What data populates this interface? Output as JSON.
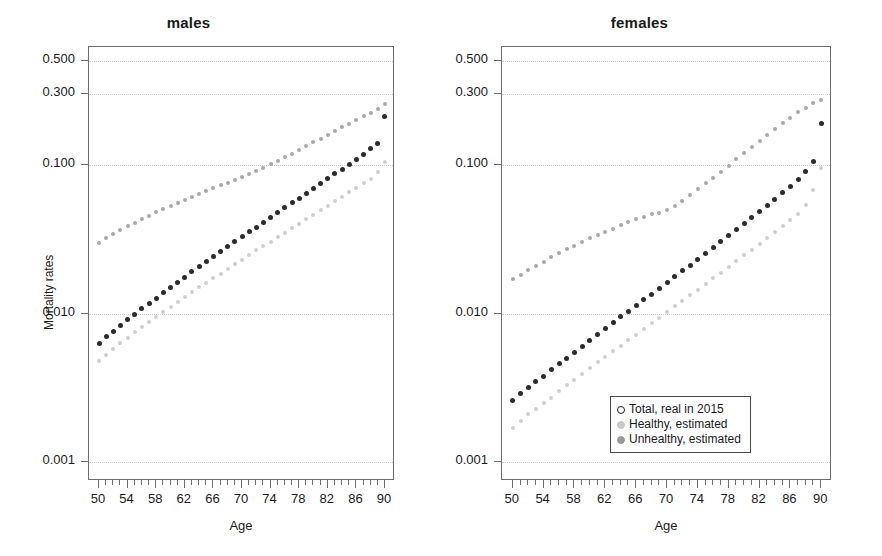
{
  "figure": {
    "xaxis_title": "Age",
    "yaxis_title": "Mortality rates"
  },
  "legend": {
    "items": [
      {
        "label": "Total, real in 2015",
        "marker": "open-circle",
        "color": "#ffffff",
        "border": "#1f1f1f"
      },
      {
        "label": "Healthy, estimated",
        "marker": "filled-circle",
        "color": "#c7c7c7",
        "border": "#c7c7c7"
      },
      {
        "label": "Unhealthy, estimated",
        "marker": "filled-circle",
        "color": "#9a9a9a",
        "border": "#9a9a9a"
      }
    ]
  },
  "chart_data": [
    {
      "type": "scatter",
      "title": "males",
      "xlabel": "Age",
      "ylabel": "Mortality rates",
      "yscale": "log",
      "ylim": [
        0.00075,
        0.62
      ],
      "xlim": [
        48.6,
        91.4
      ],
      "grid": true,
      "ytick_labels": [
        "0.500",
        "0.300",
        "0.100",
        "0.010",
        "0.001"
      ],
      "ytick_values": [
        0.5,
        0.3,
        0.1,
        0.01,
        0.001
      ],
      "xtick_labels": [
        "50",
        "54",
        "58",
        "62",
        "66",
        "70",
        "74",
        "78",
        "82",
        "86",
        "90"
      ],
      "xtick_values": [
        50,
        54,
        58,
        62,
        66,
        70,
        74,
        78,
        82,
        86,
        90
      ],
      "x": [
        50,
        51,
        52,
        53,
        54,
        55,
        56,
        57,
        58,
        59,
        60,
        61,
        62,
        63,
        64,
        65,
        66,
        67,
        68,
        69,
        70,
        71,
        72,
        73,
        74,
        75,
        76,
        77,
        78,
        79,
        80,
        81,
        82,
        83,
        84,
        85,
        86,
        87,
        88,
        89,
        90
      ],
      "series": [
        {
          "name": "Total, real in 2015",
          "color": "#2b2b2b",
          "size": 5,
          "values": [
            0.0063,
            0.007,
            0.0076,
            0.0083,
            0.0091,
            0.0099,
            0.0108,
            0.0117,
            0.0127,
            0.0138,
            0.015,
            0.0163,
            0.0176,
            0.0191,
            0.0207,
            0.0224,
            0.0242,
            0.0261,
            0.0282,
            0.0304,
            0.0328,
            0.0354,
            0.0382,
            0.0412,
            0.0444,
            0.0478,
            0.0515,
            0.0555,
            0.0598,
            0.0644,
            0.0694,
            0.0748,
            0.0806,
            0.0869,
            0.0937,
            0.101,
            0.109,
            0.118,
            0.128,
            0.14,
            0.21
          ]
        },
        {
          "name": "Healthy, estimated",
          "color": "#cfcfcf",
          "size": 4,
          "values": [
            0.0048,
            0.0053,
            0.0058,
            0.0063,
            0.0069,
            0.0075,
            0.0081,
            0.0088,
            0.0095,
            0.0103,
            0.0111,
            0.012,
            0.0129,
            0.0139,
            0.015,
            0.0161,
            0.0173,
            0.0186,
            0.02,
            0.0215,
            0.0231,
            0.0248,
            0.0266,
            0.0285,
            0.0305,
            0.0327,
            0.035,
            0.0375,
            0.0402,
            0.0431,
            0.0462,
            0.0495,
            0.0531,
            0.0569,
            0.061,
            0.0654,
            0.0701,
            0.0751,
            0.0805,
            0.09,
            0.105
          ]
        },
        {
          "name": "Unhealthy, estimated",
          "color": "#a8a8a8",
          "size": 4,
          "values": [
            0.03,
            0.0321,
            0.0342,
            0.0364,
            0.0386,
            0.0409,
            0.0432,
            0.0456,
            0.048,
            0.0505,
            0.053,
            0.0556,
            0.0583,
            0.061,
            0.0638,
            0.0667,
            0.0697,
            0.0728,
            0.076,
            0.0794,
            0.083,
            0.087,
            0.0913,
            0.096,
            0.101,
            0.1065,
            0.1125,
            0.119,
            0.126,
            0.1335,
            0.1415,
            0.15,
            0.159,
            0.1685,
            0.1785,
            0.189,
            0.2,
            0.2115,
            0.2235,
            0.236,
            0.258
          ]
        }
      ]
    },
    {
      "type": "scatter",
      "title": "females",
      "xlabel": "Age",
      "ylabel": "Mortality rates",
      "yscale": "log",
      "ylim": [
        0.00075,
        0.62
      ],
      "xlim": [
        48.6,
        91.4
      ],
      "grid": true,
      "ytick_labels": [
        "0.500",
        "0.300",
        "0.100",
        "0.010",
        "0.001"
      ],
      "ytick_values": [
        0.5,
        0.3,
        0.1,
        0.01,
        0.001
      ],
      "xtick_labels": [
        "50",
        "54",
        "58",
        "62",
        "66",
        "70",
        "74",
        "78",
        "82",
        "86",
        "90"
      ],
      "xtick_values": [
        50,
        54,
        58,
        62,
        66,
        70,
        74,
        78,
        82,
        86,
        90
      ],
      "x": [
        50,
        51,
        52,
        53,
        54,
        55,
        56,
        57,
        58,
        59,
        60,
        61,
        62,
        63,
        64,
        65,
        66,
        67,
        68,
        69,
        70,
        71,
        72,
        73,
        74,
        75,
        76,
        77,
        78,
        79,
        80,
        81,
        82,
        83,
        84,
        85,
        86,
        87,
        88,
        89,
        90
      ],
      "series": [
        {
          "name": "Total, real in 2015",
          "color": "#2b2b2b",
          "size": 5,
          "values": [
            0.0026,
            0.0029,
            0.0032,
            0.0035,
            0.0038,
            0.0042,
            0.0046,
            0.005,
            0.0055,
            0.006,
            0.0066,
            0.0072,
            0.0079,
            0.0087,
            0.0095,
            0.0104,
            0.0113,
            0.0124,
            0.0135,
            0.0148,
            0.0162,
            0.0177,
            0.0194,
            0.0212,
            0.0232,
            0.0254,
            0.0278,
            0.0305,
            0.0334,
            0.0366,
            0.0401,
            0.044,
            0.0484,
            0.0533,
            0.0588,
            0.065,
            0.072,
            0.08,
            0.09,
            0.105,
            0.19
          ]
        },
        {
          "name": "Healthy, estimated",
          "color": "#cfcfcf",
          "size": 4,
          "values": [
            0.0017,
            0.0019,
            0.0021,
            0.0023,
            0.0025,
            0.0027,
            0.003,
            0.0033,
            0.0036,
            0.0039,
            0.0043,
            0.0047,
            0.0051,
            0.0056,
            0.0061,
            0.0066,
            0.0072,
            0.0079,
            0.0086,
            0.0094,
            0.0102,
            0.0112,
            0.0122,
            0.0133,
            0.0145,
            0.0158,
            0.0173,
            0.0189,
            0.0206,
            0.0225,
            0.0246,
            0.0269,
            0.0294,
            0.0322,
            0.0353,
            0.0387,
            0.0425,
            0.0467,
            0.054,
            0.068,
            0.095
          ]
        },
        {
          "name": "Unhealthy, estimated",
          "color": "#a8a8a8",
          "size": 4,
          "values": [
            0.017,
            0.0183,
            0.0196,
            0.021,
            0.0224,
            0.0239,
            0.0254,
            0.027,
            0.0286,
            0.0303,
            0.032,
            0.0337,
            0.0355,
            0.0373,
            0.0392,
            0.0411,
            0.043,
            0.0448,
            0.0464,
            0.0478,
            0.0495,
            0.053,
            0.0575,
            0.0625,
            0.0685,
            0.075,
            0.082,
            0.09,
            0.099,
            0.109,
            0.12,
            0.132,
            0.145,
            0.159,
            0.174,
            0.19,
            0.207,
            0.225,
            0.243,
            0.26,
            0.275
          ]
        }
      ]
    }
  ]
}
